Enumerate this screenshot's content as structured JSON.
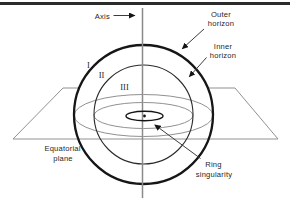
{
  "figure": {
    "type": "wireframe-diagram"
  },
  "labels": {
    "axis": "Axis",
    "outer_horizon": [
      "Outer",
      "horizon"
    ],
    "inner_horizon": [
      "Inner",
      "horizon"
    ],
    "equatorial_plane": [
      "Equatorial",
      "plane"
    ],
    "ring_singularity": [
      "Ring",
      "singularity"
    ],
    "regions": [
      "I",
      "II",
      "III"
    ]
  },
  "colors": {
    "background": "#ffffff",
    "top_border": "#2b2b2b",
    "primary_line": "#161616",
    "secondary_line": "#919191",
    "axis_line": "#8a8a8a",
    "text": "#1f1f1f"
  }
}
